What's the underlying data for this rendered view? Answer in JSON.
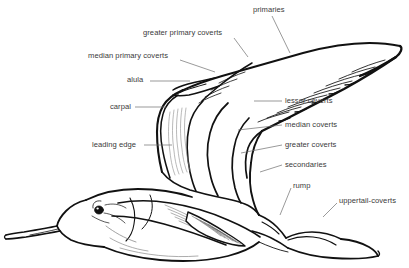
{
  "figure": {
    "background_color": "#ffffff",
    "line_color": "#111111",
    "label_color": "#3a3a3a",
    "leader_line_color": "#6e6e6e",
    "label_count": 11
  },
  "labels": [
    {
      "id": "primaries",
      "text": "primaries",
      "x": 253,
      "y": 5,
      "align": "left",
      "leader": {
        "x1": 272,
        "y1": 16,
        "x2": 290,
        "y2": 53
      }
    },
    {
      "id": "greater-primary-coverts",
      "text": "greater primary coverts",
      "x": 143,
      "y": 28,
      "align": "left",
      "leader": {
        "x1": 234,
        "y1": 38,
        "x2": 248,
        "y2": 57
      }
    },
    {
      "id": "median-primary-coverts",
      "text": "median primary coverts",
      "x": 88,
      "y": 51,
      "align": "left",
      "leader": {
        "x1": 180,
        "y1": 60,
        "x2": 215,
        "y2": 72
      }
    },
    {
      "id": "alula",
      "text": "alula",
      "x": 127,
      "y": 75,
      "align": "left",
      "leader": {
        "x1": 150,
        "y1": 81,
        "x2": 188,
        "y2": 81
      }
    },
    {
      "id": "carpal",
      "text": "carpal",
      "x": 110,
      "y": 102,
      "align": "left",
      "leader": {
        "x1": 135,
        "y1": 107,
        "x2": 165,
        "y2": 107
      }
    },
    {
      "id": "lesser-coverts",
      "text": "lesser coverts",
      "x": 285,
      "y": 96,
      "align": "left",
      "leader": {
        "x1": 282,
        "y1": 101,
        "x2": 258,
        "y2": 101
      }
    },
    {
      "id": "median-coverts",
      "text": "median coverts",
      "x": 285,
      "y": 120,
      "align": "left",
      "leader": {
        "x1": 282,
        "y1": 125,
        "x2": 240,
        "y2": 129
      }
    },
    {
      "id": "greater-coverts",
      "text": "greater coverts",
      "x": 285,
      "y": 140,
      "align": "left",
      "leader": {
        "x1": 282,
        "y1": 145,
        "x2": 243,
        "y2": 152
      }
    },
    {
      "id": "secondaries",
      "text": "secondaries",
      "x": 285,
      "y": 160,
      "align": "left",
      "leader": {
        "x1": 282,
        "y1": 165,
        "x2": 262,
        "y2": 171
      }
    },
    {
      "id": "leading-edge",
      "text": "leading edge",
      "x": 92,
      "y": 140,
      "align": "left",
      "leader": {
        "x1": 144,
        "y1": 145,
        "x2": 170,
        "y2": 145
      }
    },
    {
      "id": "rump",
      "text": "rump",
      "x": 291,
      "y": 181,
      "align": "left",
      "leader": {
        "x1": 290,
        "y1": 188,
        "x2": 279,
        "y2": 214
      }
    },
    {
      "id": "uppertail-coverts",
      "text": "uppertail-coverts",
      "x": 337,
      "y": 196,
      "align": "left",
      "leader": {
        "x1": 336,
        "y1": 203,
        "x2": 322,
        "y2": 216
      }
    }
  ],
  "anatomy_parts": [
    "primaries",
    "greater primary coverts",
    "median primary coverts",
    "alula",
    "carpal",
    "lesser coverts",
    "median coverts",
    "greater coverts",
    "secondaries",
    "leading edge",
    "rump",
    "uppertail-coverts"
  ]
}
